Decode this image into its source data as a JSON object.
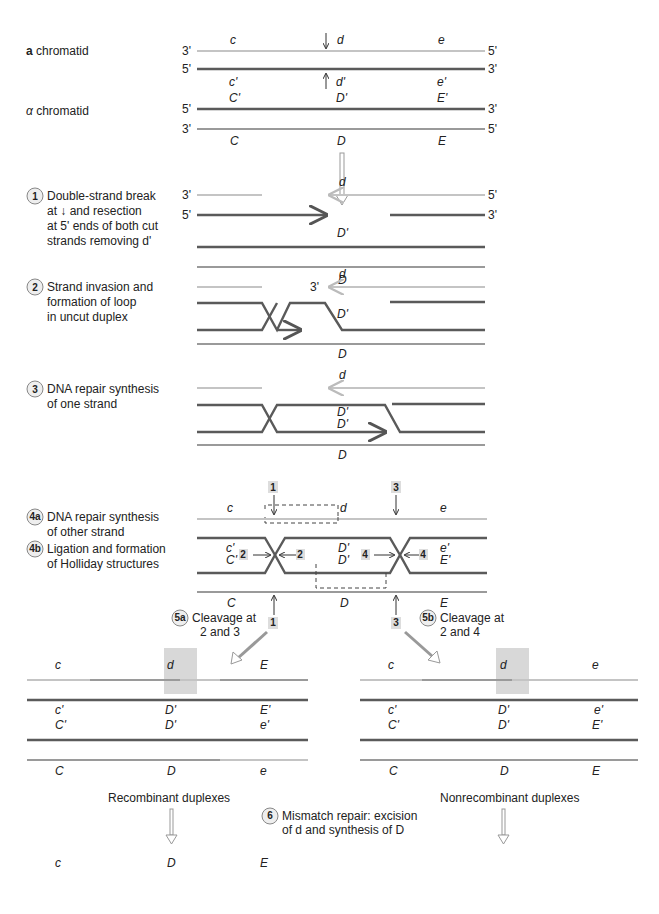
{
  "header": {
    "a_chromatid_bold": "a",
    "a_chromatid_rest": " chromatid",
    "alpha_chromatid_greek": "α",
    "alpha_chromatid_rest": " chromatid"
  },
  "ends": {
    "three": "3'",
    "five": "5'"
  },
  "alleles": {
    "c": "c",
    "d": "d",
    "e": "e",
    "c_prime": "c'",
    "d_prime": "d'",
    "e_prime": "e'",
    "C_prime": "C'",
    "D_prime": "D'",
    "E_prime": "E'",
    "C": "C",
    "D": "D",
    "E": "E"
  },
  "steps": [
    {
      "num": "1",
      "lines": [
        "Double-strand break",
        "at ↓ and resection",
        "at 5' ends of both cut",
        "strands removing d'"
      ]
    },
    {
      "num": "2",
      "lines": [
        "Strand invasion and",
        "formation of loop",
        "in uncut duplex"
      ]
    },
    {
      "num": "3",
      "lines": [
        "DNA repair synthesis",
        "of one strand"
      ]
    },
    {
      "num": "4a",
      "lines": [
        "DNA repair synthesis",
        "of other strand"
      ]
    },
    {
      "num": "4b",
      "lines": [
        "Ligation and formation",
        "of Holliday structures"
      ]
    },
    {
      "num": "5a",
      "lines": [
        "Cleavage at",
        "2 and 3"
      ]
    },
    {
      "num": "5b",
      "lines": [
        "Cleavage at",
        "2 and 4"
      ]
    },
    {
      "num": "6",
      "lines": [
        "Mismatch repair: excision",
        "of d and synthesis of D"
      ]
    }
  ],
  "cleavage_sites": {
    "s1": "1",
    "s2": "2",
    "s3": "3",
    "s4": "4"
  },
  "results": {
    "recombinant_label": "Recombinant duplexes",
    "nonrecombinant_label": "Nonrecombinant duplexes",
    "recombinant_5a": {
      "top": [
        "c",
        "d",
        "E"
      ],
      "row2": [
        "c'",
        "D'",
        "E'"
      ],
      "row3": [
        "C'",
        "D'",
        "e'"
      ],
      "bottom": [
        "C",
        "D",
        "e"
      ]
    },
    "nonrecombinant_5b": {
      "top": [
        "c",
        "d",
        "e"
      ],
      "row2": [
        "c'",
        "D'",
        "e'"
      ],
      "row3": [
        "C'",
        "D'",
        "E'"
      ],
      "bottom": [
        "C",
        "D",
        "E"
      ]
    },
    "recombinant_6": {
      "top": [
        "c",
        "D",
        "E"
      ],
      "row2": [
        "c'",
        "D'",
        "E'"
      ],
      "row3": [
        "C'",
        "D'",
        "e'"
      ],
      "bottom": [
        "C",
        "D",
        "e"
      ]
    },
    "nonrecombinant_6": {
      "top": [
        "c",
        "D",
        "e"
      ],
      "row2": [
        "c'",
        "D'",
        "e'"
      ],
      "row3": [
        "C'",
        "D'",
        "E'"
      ],
      "bottom": [
        "C",
        "D",
        "E"
      ]
    }
  },
  "colors": {
    "light_strand": "#c4c4c4",
    "mid_strand": "#9a9a9a",
    "dark_strand": "#5a5a5a",
    "highlight": "#d8d8d8"
  }
}
